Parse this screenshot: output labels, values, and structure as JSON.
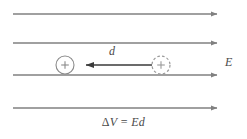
{
  "figure": {
    "background_color": "#ffffff",
    "width": 247,
    "height": 139
  },
  "colors": {
    "field_line": "#808080",
    "displacement_arrow": "#3a3a3a",
    "charge_outline": "#8a8a8a",
    "dashed_charge_outline": "#9a9a9a",
    "text": "#4a4a4a"
  },
  "field": {
    "label": "E",
    "line_count": 4,
    "direction": "right",
    "lines": [
      {
        "y": 14,
        "x_start": 13,
        "x_end": 224
      },
      {
        "y": 43,
        "x_start": 13,
        "x_end": 224
      },
      {
        "y": 75,
        "x_start": 13,
        "x_end": 224
      },
      {
        "y": 108,
        "x_start": 13,
        "x_end": 224
      }
    ]
  },
  "charges": {
    "final": {
      "sign": "+",
      "style": "solid",
      "cx": 65,
      "cy": 65,
      "r": 9
    },
    "initial": {
      "sign": "+",
      "style": "dashed",
      "cx": 161,
      "cy": 65,
      "r": 9
    }
  },
  "displacement": {
    "label": "d",
    "direction": "left",
    "x_tail": 152,
    "x_head": 78,
    "y": 65
  },
  "equation": {
    "delta": "Δ",
    "voltage_symbol": "V",
    "equals": "=",
    "field_symbol": "E",
    "distance_symbol": "d",
    "full_text": "ΔV = Ed"
  }
}
